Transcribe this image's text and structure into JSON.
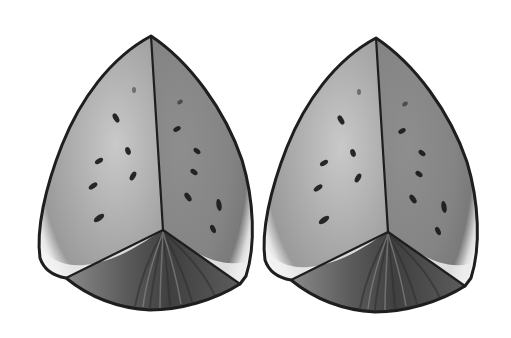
{
  "image": {
    "width": 511,
    "height": 338,
    "background": "#ffffff",
    "subject": "two watermelon wedges, grayscale illustration",
    "palette": {
      "outline": "#1e1e1e",
      "left_face": "#bdbdbd",
      "right_face": "#8c8c8c",
      "rind_highlight": "#f4f4f4",
      "rind_bottom": "#4a4a4a",
      "seed": "#2a2a2a"
    }
  },
  "wedges": [
    {
      "id": "left",
      "offset_x": 0
    },
    {
      "id": "right",
      "offset_x": 225
    }
  ]
}
